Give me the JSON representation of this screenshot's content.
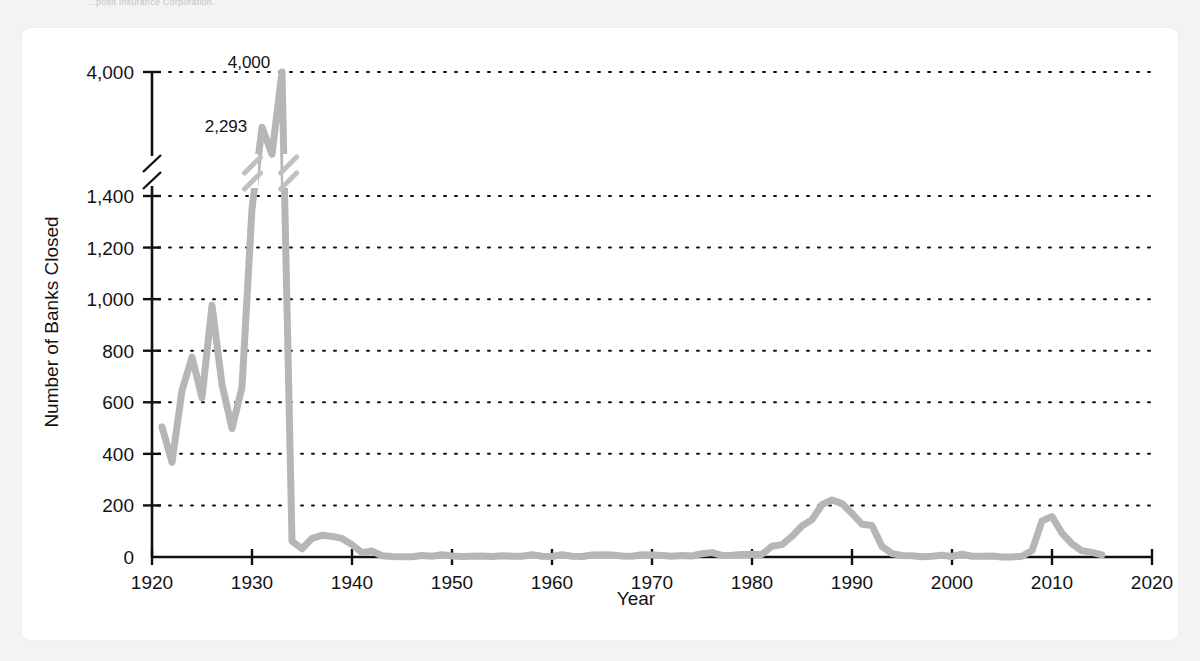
{
  "page": {
    "background_color": "#f2f2f2",
    "card_background": "#ffffff",
    "source_note": "...posit Insurance Corporation."
  },
  "chart_data": {
    "type": "line",
    "title": "",
    "xlabel": "Year",
    "ylabel": "Number of Banks Closed",
    "xlim": [
      1920,
      2020
    ],
    "ylim": [
      0,
      4000
    ],
    "xticks": [
      "1920",
      "1930",
      "1940",
      "1950",
      "1960",
      "1970",
      "1980",
      "1990",
      "2000",
      "2010",
      "2020"
    ],
    "xtick_values": [
      1920,
      1930,
      1940,
      1950,
      1960,
      1970,
      1980,
      1990,
      2000,
      2010,
      2020
    ],
    "yticks": [
      "0",
      "200",
      "400",
      "600",
      "800",
      "1,000",
      "1,200",
      "1,400",
      "4,000"
    ],
    "ytick_values": [
      0,
      200,
      400,
      600,
      800,
      1000,
      1200,
      1400,
      4000
    ],
    "axis_break": {
      "between": [
        1400,
        4000
      ],
      "style": "double-slash",
      "note": "y-axis is broken between 1,400 and 4,000"
    },
    "grid": "horizontal dotted",
    "legend": "none",
    "line_color": "#b6b6b6",
    "annotations": [
      {
        "label": "4,000",
        "x": 1933,
        "y": 4000
      },
      {
        "label": "2,293",
        "x": 1931,
        "y": 2293
      }
    ],
    "series": [
      {
        "name": "Number of Banks Closed",
        "x": [
          1921,
          1922,
          1923,
          1924,
          1925,
          1926,
          1927,
          1928,
          1929,
          1930,
          1931,
          1932,
          1933,
          1934,
          1935,
          1936,
          1937,
          1938,
          1939,
          1940,
          1941,
          1942,
          1943,
          1944,
          1945,
          1946,
          1947,
          1948,
          1949,
          1950,
          1951,
          1952,
          1953,
          1954,
          1955,
          1956,
          1957,
          1958,
          1959,
          1960,
          1961,
          1962,
          1963,
          1964,
          1965,
          1966,
          1967,
          1968,
          1969,
          1970,
          1971,
          1972,
          1973,
          1974,
          1975,
          1976,
          1977,
          1978,
          1979,
          1980,
          1981,
          1982,
          1983,
          1984,
          1985,
          1986,
          1987,
          1988,
          1989,
          1990,
          1991,
          1992,
          1993,
          1994,
          1995,
          1996,
          1997,
          1998,
          1999,
          2000,
          2001,
          2002,
          2003,
          2004,
          2005,
          2006,
          2007,
          2008,
          2009,
          2010,
          2011,
          2012,
          2013,
          2014,
          2015
        ],
        "y": [
          505,
          367,
          646,
          775,
          618,
          976,
          669,
          498,
          659,
          1350,
          2293,
          1453,
          4000,
          61,
          32,
          72,
          84,
          80,
          72,
          48,
          17,
          23,
          5,
          2,
          1,
          1,
          6,
          3,
          9,
          4,
          2,
          3,
          4,
          2,
          5,
          3,
          3,
          9,
          3,
          2,
          9,
          3,
          2,
          8,
          9,
          8,
          4,
          3,
          9,
          8,
          6,
          3,
          6,
          4,
          13,
          17,
          6,
          7,
          10,
          11,
          10,
          42,
          48,
          80,
          120,
          145,
          203,
          221,
          207,
          169,
          127,
          122,
          41,
          13,
          6,
          5,
          1,
          3,
          7,
          2,
          11,
          3,
          3,
          4,
          0,
          0,
          3,
          25,
          140,
          157,
          92,
          51,
          24,
          18,
          8
        ]
      }
    ]
  }
}
